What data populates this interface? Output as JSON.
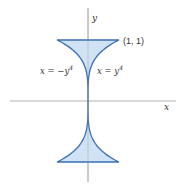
{
  "diagram": {
    "type": "region-plot",
    "axes": {
      "x_label": "x",
      "y_label": "y"
    },
    "point_label": "(1, 1)",
    "curves": [
      {
        "name": "left",
        "equation_prefix": "x = −y",
        "exponent": "4"
      },
      {
        "name": "right",
        "equation_prefix": "x = y",
        "exponent": "4"
      }
    ],
    "colors": {
      "fill": "#cfe3f5",
      "stroke": "#3a6fb5",
      "axis": "#9a9a9a",
      "text": "#333333"
    },
    "geometry": {
      "origin_px": [
        88,
        101
      ],
      "unit_x_px": 31,
      "unit_y_px": 61,
      "y_range": [
        -1,
        1
      ]
    }
  }
}
